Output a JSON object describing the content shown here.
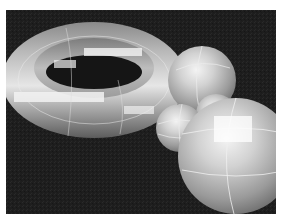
{
  "image": {
    "description": "Grayscale 3D render of a torus and spheres with faceted shading on a dark background",
    "background_color": "#202020",
    "border_color": "#ffffff",
    "objects": [
      {
        "type": "torus",
        "name": "ring"
      },
      {
        "type": "sphere",
        "name": "sphere-back"
      },
      {
        "type": "sphere",
        "name": "sphere-small"
      },
      {
        "type": "sphere",
        "name": "sphere-hidden"
      },
      {
        "type": "sphere",
        "name": "sphere-front"
      }
    ]
  }
}
